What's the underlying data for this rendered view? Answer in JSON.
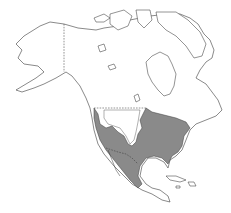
{
  "map": {
    "region": "North America",
    "type": "species range map",
    "range_fill_color": "#8a8a8a",
    "outline_color": "#3a3a3a",
    "background_color": "#ffffff",
    "shaded_range_description": "Eastern and central United States, Pacific coast south through western Mexico, excluding the interior western plateau and southern Great Plains gap",
    "borders_shown": [
      "Alaska-Canada",
      "Canada-United States",
      "United States-Mexico"
    ],
    "labels": []
  }
}
